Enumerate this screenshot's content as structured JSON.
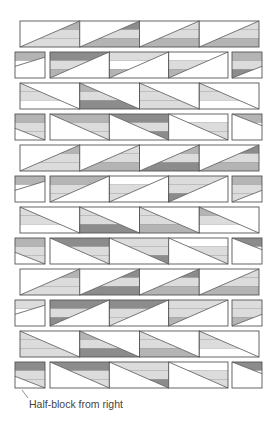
{
  "diagram": {
    "type": "quilt-layout",
    "caption": "Half-block from right",
    "colors": {
      "outline": "#555555",
      "white": "#ffffff",
      "light": "#dcdcdc",
      "mid": "#b4b4b4",
      "dark": "#8c8c8c"
    },
    "rows": [
      {
        "y": 21,
        "layout": "full",
        "diag": "up",
        "shade": "below",
        "blocks": [
          [
            "mid",
            "light",
            "light"
          ],
          [
            "dark",
            "light",
            "mid"
          ],
          [
            "light",
            "light",
            "mid"
          ],
          [
            "light",
            "light",
            "mid"
          ]
        ]
      },
      {
        "y": 52,
        "layout": "split",
        "diag": "up",
        "shade": "above",
        "left": [
          "mid",
          "white",
          "white"
        ],
        "blocks": [
          [
            "dark",
            "light",
            "mid"
          ],
          [
            "light",
            "white",
            "mid"
          ],
          [
            "white",
            "light",
            "mid"
          ]
        ],
        "right": [
          "mid",
          "light",
          "dark"
        ]
      },
      {
        "y": 83,
        "layout": "full",
        "diag": "down",
        "shade": "below",
        "blocks": [
          [
            "light",
            "light",
            "white"
          ],
          [
            "mid",
            "light",
            "dark"
          ],
          [
            "light",
            "light",
            "light"
          ],
          [
            "light",
            "light",
            "white"
          ]
        ]
      },
      {
        "y": 114,
        "layout": "split",
        "diag": "down",
        "shade": "above",
        "left": [
          "mid",
          "light",
          "light"
        ],
        "blocks": [
          [
            "mid",
            "light",
            "light"
          ],
          [
            "dark",
            "light",
            "dark"
          ],
          [
            "white",
            "light",
            "light"
          ]
        ],
        "right": [
          "mid",
          "white",
          "white"
        ]
      },
      {
        "y": 145,
        "layout": "full",
        "diag": "up",
        "shade": "below",
        "blocks": [
          [
            "mid",
            "light",
            "light"
          ],
          [
            "light",
            "light",
            "mid"
          ],
          [
            "mid",
            "light",
            "dark"
          ],
          [
            "dark",
            "light",
            "mid"
          ]
        ]
      },
      {
        "y": 176,
        "layout": "split",
        "diag": "up",
        "shade": "above",
        "left": [
          "mid",
          "white",
          "white"
        ],
        "blocks": [
          [
            "mid",
            "light",
            "light"
          ],
          [
            "white",
            "light",
            "light"
          ],
          [
            "light",
            "light",
            "dark"
          ]
        ],
        "right": [
          "mid",
          "light",
          "light"
        ]
      },
      {
        "y": 207,
        "layout": "full",
        "diag": "down",
        "shade": "below",
        "blocks": [
          [
            "light",
            "light",
            "white"
          ],
          [
            "light",
            "light",
            "dark"
          ],
          [
            "light",
            "light",
            "mid"
          ],
          [
            "mid",
            "light",
            "white"
          ]
        ]
      },
      {
        "y": 238,
        "layout": "split",
        "diag": "down",
        "shade": "above",
        "left": [
          "mid",
          "light",
          "light"
        ],
        "blocks": [
          [
            "dark",
            "light",
            "light"
          ],
          [
            "light",
            "light",
            "dark"
          ],
          [
            "white",
            "light",
            "light"
          ]
        ],
        "right": [
          "dark",
          "white",
          "white"
        ]
      },
      {
        "y": 269,
        "layout": "full",
        "diag": "up",
        "shade": "below",
        "blocks": [
          [
            "mid",
            "light",
            "light"
          ],
          [
            "dark",
            "light",
            "dark"
          ],
          [
            "dark",
            "light",
            "mid"
          ],
          [
            "light",
            "light",
            "mid"
          ]
        ]
      },
      {
        "y": 300,
        "layout": "split",
        "diag": "up",
        "shade": "above",
        "left": [
          "light",
          "white",
          "white"
        ],
        "blocks": [
          [
            "dark",
            "light",
            "dark"
          ],
          [
            "dark",
            "light",
            "light"
          ],
          [
            "light",
            "light",
            "mid"
          ]
        ],
        "right": [
          "light",
          "light",
          "mid"
        ]
      },
      {
        "y": 331,
        "layout": "full",
        "diag": "down",
        "shade": "below",
        "blocks": [
          [
            "light",
            "light",
            "light"
          ],
          [
            "mid",
            "light",
            "dark"
          ],
          [
            "light",
            "light",
            "mid"
          ],
          [
            "light",
            "light",
            "white"
          ]
        ]
      },
      {
        "y": 362,
        "layout": "split",
        "diag": "down",
        "shade": "above",
        "left": [
          "dark",
          "light",
          "light"
        ],
        "blocks": [
          [
            "dark",
            "light",
            "light"
          ],
          [
            "light",
            "light",
            "dark"
          ],
          [
            "white",
            "light",
            "light"
          ]
        ],
        "right": [
          "dark",
          "white",
          "white"
        ]
      }
    ],
    "geometry": {
      "row_height": 26,
      "full": {
        "x0": 20,
        "x1": 259,
        "count": 4
      },
      "split": {
        "left": [
          15,
          45
        ],
        "main": [
          50,
          228
        ],
        "right": [
          232,
          262
        ],
        "count": 3
      }
    },
    "annotation": {
      "leader": {
        "x1": 22,
        "y1": 390,
        "x2": 28,
        "y2": 398
      }
    }
  }
}
